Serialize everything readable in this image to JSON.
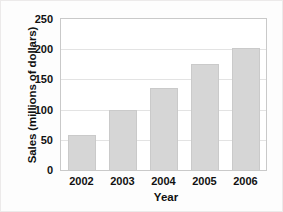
{
  "chart_data": {
    "type": "bar",
    "title": "",
    "xlabel": "Year",
    "ylabel": "Sales (millions of dollars)",
    "categories": [
      "2002",
      "2003",
      "2004",
      "2005",
      "2006"
    ],
    "values": [
      58,
      100,
      135,
      175,
      202
    ],
    "ylim": [
      0,
      250
    ],
    "yticks": [
      "0",
      "50",
      "100",
      "150",
      "200",
      "250"
    ],
    "ytick_values": [
      0,
      50,
      100,
      150,
      200,
      250
    ],
    "grid": true,
    "legend": false,
    "bar_color": "#d6d6d6",
    "bar_edge_color": "#cacaca",
    "grid_color": "#e3e3e3",
    "frame_color": "#c9c9c9",
    "background": "#ffffff",
    "text_color": "#111111"
  }
}
